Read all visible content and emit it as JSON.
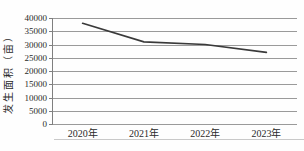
{
  "colors": {
    "background": "#fefefe",
    "line": "#3a3a3a",
    "grid": "#9a9a9a",
    "axis": "#7f7f7f",
    "text": "#2a2a2a",
    "document_rule": "#c9c9c9"
  },
  "chart_data": {
    "type": "line",
    "categories": [
      "2020年",
      "2021年",
      "2022年",
      "2023年"
    ],
    "values": [
      38000,
      31000,
      30000,
      27000
    ],
    "title": "",
    "xlabel": "",
    "ylabel": "发生面积（亩）",
    "ylim": [
      0,
      40000
    ],
    "yticks": [
      0,
      5000,
      10000,
      15000,
      20000,
      25000,
      30000,
      35000,
      40000
    ],
    "grid": true,
    "legend": "none"
  }
}
